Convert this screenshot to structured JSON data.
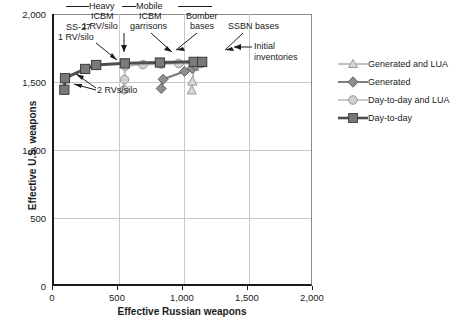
{
  "chart_data": {
    "type": "scatter",
    "title": "",
    "xlabel": "Effective Russian weapons",
    "ylabel": "Effective U.S. weapons",
    "xlim": [
      0,
      2000
    ],
    "ylim": [
      0,
      2000
    ],
    "xticks": [
      "0",
      "500",
      "1,000",
      "1,500",
      "2,000"
    ],
    "xtick_values": [
      0,
      500,
      1000,
      1500,
      2000
    ],
    "yticks": [
      "0",
      "500",
      "1,000",
      "1,500",
      "2,000"
    ],
    "ytick_values": [
      0,
      500,
      1000,
      1500,
      2000
    ],
    "grid": true,
    "legend_position": "right",
    "series": [
      {
        "name": "Generated and LUA",
        "marker": "triangle",
        "color": "#b3b3b3",
        "line_color": "#b3b3b3",
        "points": [
          {
            "x": 1075,
            "y": 1440
          },
          {
            "x": 1080,
            "y": 1505
          },
          {
            "x": 1095,
            "y": 1612
          },
          {
            "x": 1150,
            "y": 1640
          }
        ]
      },
      {
        "name": "Generated",
        "marker": "diamond",
        "color": "#7d7d7d",
        "line_color": "#7d7d7d",
        "points": [
          {
            "x": 840,
            "y": 1452
          },
          {
            "x": 855,
            "y": 1520
          },
          {
            "x": 1020,
            "y": 1578
          },
          {
            "x": 1078,
            "y": 1600
          },
          {
            "x": 1105,
            "y": 1618
          },
          {
            "x": 1150,
            "y": 1640
          }
        ]
      },
      {
        "name": "Day-to-day and LUA",
        "marker": "circle",
        "color": "#bdbdbd",
        "line_color": "#bdbdbd",
        "points": [
          {
            "x": 555,
            "y": 1443
          },
          {
            "x": 558,
            "y": 1518
          },
          {
            "x": 562,
            "y": 1617
          },
          {
            "x": 700,
            "y": 1628
          },
          {
            "x": 840,
            "y": 1632
          },
          {
            "x": 975,
            "y": 1636
          },
          {
            "x": 1090,
            "y": 1638
          },
          {
            "x": 1150,
            "y": 1640
          }
        ]
      },
      {
        "name": "Day-to-day",
        "marker": "square",
        "color": "#6e6e6e",
        "line_color": "#6e6e6e",
        "points": [
          {
            "x": 95,
            "y": 1443
          },
          {
            "x": 100,
            "y": 1528
          },
          {
            "x": 255,
            "y": 1596
          },
          {
            "x": 340,
            "y": 1625
          },
          {
            "x": 560,
            "y": 1637
          },
          {
            "x": 830,
            "y": 1643
          },
          {
            "x": 1090,
            "y": 1648
          },
          {
            "x": 1155,
            "y": 1648
          }
        ]
      }
    ],
    "annotations": [
      {
        "id": "ss27",
        "text_lines": [
          "SS-27",
          "1 RV/silo"
        ],
        "target_x": 255,
        "target_y": 1596
      },
      {
        "id": "two-rvs",
        "text_lines": [
          "2 RVs/silo"
        ],
        "target_x": 95,
        "target_y": 1443
      },
      {
        "id": "heavy-icbm",
        "text_lines": [
          "Heavy",
          "ICBM",
          "1 RV/silo"
        ],
        "target_x": 340,
        "target_y": 1625
      },
      {
        "id": "mobile-icbm",
        "text_lines": [
          "Mobile",
          "ICBM",
          "garrisons"
        ],
        "target_x": 560,
        "target_y": 1637
      },
      {
        "id": "bomber-bases",
        "text_lines": [
          "Bomber",
          "bases"
        ],
        "target_x": 830,
        "target_y": 1643
      },
      {
        "id": "ssbn-bases",
        "text_lines": [
          "SSBN bases"
        ],
        "target_x": 1060,
        "target_y": 1645
      },
      {
        "id": "initial-inventories",
        "text_lines": [
          "Initial",
          "inventories"
        ],
        "target_x": 1155,
        "target_y": 1648
      }
    ]
  },
  "labels": {
    "ss27_line1": "SS-27",
    "ss27_line2": "1 RV/silo",
    "two_rvs": "2 RVs/silo",
    "heavy": "Heavy",
    "heavy_icbm": "ICBM",
    "heavy_rv": "1 RV/silo",
    "mobile": "Mobile",
    "mobile_icbm": "ICBM",
    "mobile_garrisons": "garrisons",
    "bomber_line1": "Bomber",
    "bomber_line2": "bases",
    "ssbn": "SSBN bases",
    "initial_line1": "Initial",
    "initial_line2": "inventories"
  },
  "axes": {
    "xlabel": "Effective Russian weapons",
    "ylabel": "Effective U.S. weapons",
    "x0": "0",
    "x1": "500",
    "x2": "1,000",
    "x3": "1,500",
    "x4": "2,000",
    "y0": "0",
    "y1": "500",
    "y2": "1,000",
    "y3": "1,500",
    "y4": "2,000"
  },
  "legend": {
    "items": [
      {
        "label": "Generated and LUA",
        "marker": "triangle",
        "color": "#b3b3b3"
      },
      {
        "label": "Generated",
        "marker": "diamond",
        "color": "#7d7d7d"
      },
      {
        "label": "Day-to-day and LUA",
        "marker": "circle",
        "color": "#bdbdbd"
      },
      {
        "label": "Day-to-day",
        "marker": "square",
        "color": "#6e6e6e"
      }
    ]
  }
}
